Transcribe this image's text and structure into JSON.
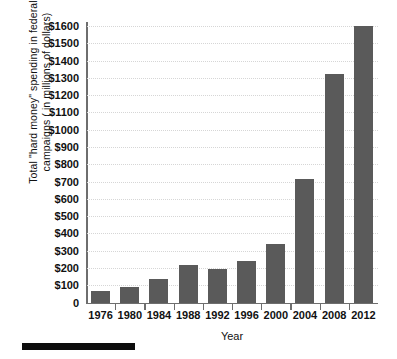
{
  "chart_data": {
    "type": "bar",
    "title": "",
    "xlabel": "Year",
    "ylabel": "Total \"hard money\" spending in federal campaigns ( in millions of dollars)",
    "ylabel_lines": [
      "Total \"hard money\" spending in federal",
      "campaigns ( in millions of dollars)"
    ],
    "categories": [
      "1976",
      "1980",
      "1984",
      "1988",
      "1992",
      "1996",
      "2000",
      "2004",
      "2008",
      "2012"
    ],
    "values": [
      68,
      92,
      136,
      215,
      192,
      240,
      340,
      715,
      1320,
      1600
    ],
    "ylim": [
      0,
      1600
    ],
    "ytick_values": [
      0,
      100,
      200,
      300,
      400,
      500,
      600,
      700,
      800,
      900,
      1000,
      1100,
      1200,
      1300,
      1400,
      1500,
      1600
    ],
    "ytick_labels": [
      "0",
      "$100",
      "$200",
      "$300",
      "$400",
      "$500",
      "$600",
      "$700",
      "$800",
      "$900",
      "$1000",
      "$1100",
      "$1200",
      "$1300",
      "$1400",
      "$1500",
      "$1600"
    ],
    "grid": true,
    "grid_axis": "y",
    "grid_style": "dotted",
    "legend": false,
    "bar_color": "#5a5a5a",
    "axis_color": "#6e6e6e",
    "grid_color": "#d6d6d6",
    "background_color": "#ffffff"
  },
  "annotations": {
    "redaction_bar_label": ""
  }
}
